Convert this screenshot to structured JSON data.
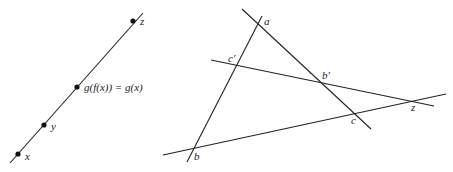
{
  "left_diagram": {
    "line": {
      "x1": 10,
      "y1": 163,
      "x2": 143,
      "y2": 13
    },
    "points": [
      {
        "id": "x",
        "label": "x",
        "cx": 18,
        "cy": 154,
        "lx": 25,
        "ly": 160
      },
      {
        "id": "y",
        "label": "y",
        "cx": 44,
        "cy": 125,
        "lx": 51,
        "ly": 130
      },
      {
        "id": "g",
        "label": "g(f(x)) = g(x)",
        "cx": 77,
        "cy": 87,
        "lx": 84,
        "ly": 91
      },
      {
        "id": "z",
        "label": "z",
        "cx": 133,
        "cy": 21,
        "lx": 140,
        "ly": 25
      }
    ]
  },
  "right_diagram": {
    "lines": [
      {
        "id": "line-ab",
        "x1": 262,
        "y1": 16,
        "x2": 187,
        "y2": 162
      },
      {
        "id": "line-ac",
        "x1": 242,
        "y1": 9,
        "x2": 371,
        "y2": 129
      },
      {
        "id": "line-cprime-z",
        "x1": 211,
        "y1": 60,
        "x2": 434,
        "y2": 106
      },
      {
        "id": "line-b-z",
        "x1": 163,
        "y1": 155,
        "x2": 446,
        "y2": 94
      }
    ],
    "labels": [
      {
        "id": "a",
        "text": "a",
        "x": 264,
        "y": 25
      },
      {
        "id": "c-prime",
        "text": "c′",
        "x": 228,
        "y": 62
      },
      {
        "id": "b-prime",
        "text": "b′",
        "x": 322,
        "y": 79
      },
      {
        "id": "c",
        "text": "c",
        "x": 351,
        "y": 124
      },
      {
        "id": "z",
        "text": "z",
        "x": 411,
        "y": 111
      },
      {
        "id": "b",
        "text": "b",
        "x": 194,
        "y": 160
      }
    ]
  }
}
